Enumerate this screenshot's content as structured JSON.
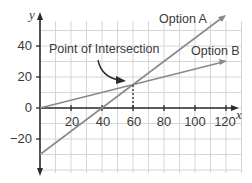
{
  "chart_data": {
    "type": "line",
    "title": "",
    "xlabel": "x",
    "ylabel": "y",
    "xlim": [
      0,
      130
    ],
    "ylim": [
      -40,
      60
    ],
    "grid": true,
    "x_ticks": [
      20,
      40,
      60,
      80,
      100,
      120
    ],
    "y_ticks": [
      -20,
      0,
      20,
      40
    ],
    "x_tick_labels": [
      "20",
      "40",
      "60",
      "80",
      "100",
      "120"
    ],
    "y_tick_labels": [
      "−20",
      "0",
      "20",
      "40"
    ],
    "series": [
      {
        "name": "Option A",
        "x": [
          0,
          40,
          60,
          120
        ],
        "y": [
          -30,
          0,
          15,
          60
        ],
        "color": "#8a8a8a"
      },
      {
        "name": "Option B",
        "x": [
          0,
          60,
          120
        ],
        "y": [
          0,
          15,
          30
        ],
        "color": "#8a8a8a"
      }
    ],
    "annotations": [
      {
        "text": "Point of Intersection",
        "point": [
          60,
          15
        ]
      }
    ],
    "legend": "inline labels at line ends"
  },
  "labels": {
    "y_axis": "y",
    "x_axis": "x",
    "option_a": "Option A",
    "option_b": "Option B",
    "intersection": "Point of Intersection",
    "x_ticks": [
      "20",
      "40",
      "60",
      "80",
      "100",
      "120"
    ],
    "y_ticks": [
      "40",
      "20",
      "0",
      "−20"
    ]
  },
  "colors": {
    "grid": "#d4d4d4",
    "axis": "#2b2b2b",
    "line": "#8a8a8a",
    "text": "#3a3a3a"
  }
}
